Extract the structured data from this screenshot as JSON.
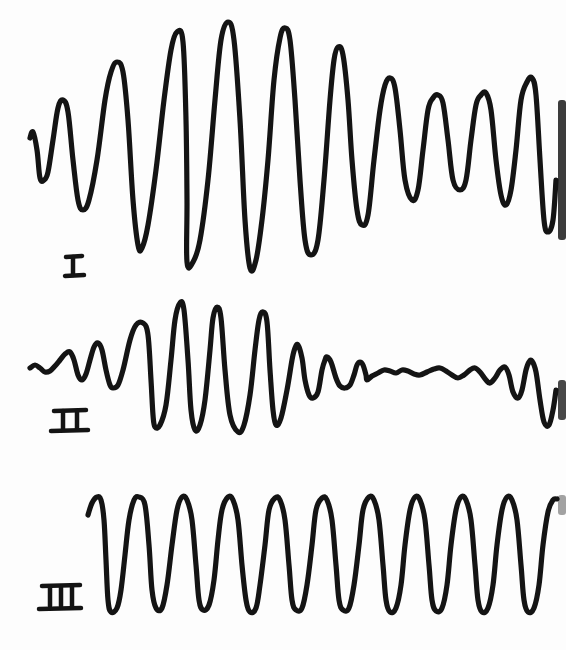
{
  "figure": {
    "background_color": "#fdfdfd",
    "ink_color": "#141414"
  },
  "traces": [
    {
      "label": "I",
      "label_position": {
        "x": 72,
        "y": 268
      },
      "shape": "amplitude builds up to a maximum near the middle then decays slowly (beat-like envelope)",
      "points": [
        [
          30,
          138
        ],
        [
          33,
          132
        ],
        [
          37,
          150
        ],
        [
          40,
          178
        ],
        [
          44,
          180
        ],
        [
          48,
          172
        ],
        [
          53,
          140
        ],
        [
          58,
          108
        ],
        [
          63,
          100
        ],
        [
          68,
          112
        ],
        [
          73,
          160
        ],
        [
          78,
          200
        ],
        [
          83,
          210
        ],
        [
          89,
          200
        ],
        [
          97,
          160
        ],
        [
          105,
          100
        ],
        [
          111,
          72
        ],
        [
          117,
          62
        ],
        [
          123,
          72
        ],
        [
          128,
          120
        ],
        [
          133,
          200
        ],
        [
          138,
          245
        ],
        [
          142,
          248
        ],
        [
          148,
          225
        ],
        [
          156,
          170
        ],
        [
          164,
          100
        ],
        [
          171,
          50
        ],
        [
          177,
          32
        ],
        [
          183,
          42
        ],
        [
          186,
          120
        ],
        [
          187,
          200
        ],
        [
          187,
          262
        ],
        [
          193,
          262
        ],
        [
          200,
          240
        ],
        [
          208,
          180
        ],
        [
          215,
          100
        ],
        [
          221,
          40
        ],
        [
          228,
          22
        ],
        [
          234,
          40
        ],
        [
          240,
          120
        ],
        [
          245,
          220
        ],
        [
          250,
          268
        ],
        [
          256,
          260
        ],
        [
          262,
          220
        ],
        [
          268,
          160
        ],
        [
          274,
          80
        ],
        [
          280,
          38
        ],
        [
          285,
          28
        ],
        [
          290,
          40
        ],
        [
          295,
          100
        ],
        [
          300,
          180
        ],
        [
          305,
          240
        ],
        [
          311,
          255
        ],
        [
          318,
          240
        ],
        [
          324,
          180
        ],
        [
          330,
          100
        ],
        [
          334,
          60
        ],
        [
          338,
          47
        ],
        [
          343,
          55
        ],
        [
          348,
          100
        ],
        [
          352,
          160
        ],
        [
          357,
          210
        ],
        [
          362,
          225
        ],
        [
          368,
          215
        ],
        [
          374,
          160
        ],
        [
          380,
          110
        ],
        [
          385,
          85
        ],
        [
          390,
          78
        ],
        [
          395,
          88
        ],
        [
          400,
          130
        ],
        [
          405,
          180
        ],
        [
          412,
          200
        ],
        [
          418,
          190
        ],
        [
          423,
          150
        ],
        [
          428,
          110
        ],
        [
          433,
          98
        ],
        [
          438,
          95
        ],
        [
          443,
          103
        ],
        [
          448,
          140
        ],
        [
          453,
          180
        ],
        [
          460,
          190
        ],
        [
          466,
          180
        ],
        [
          471,
          140
        ],
        [
          476,
          105
        ],
        [
          481,
          95
        ],
        [
          486,
          93
        ],
        [
          491,
          110
        ],
        [
          496,
          160
        ],
        [
          501,
          195
        ],
        [
          506,
          205
        ],
        [
          511,
          190
        ],
        [
          516,
          150
        ],
        [
          521,
          100
        ],
        [
          527,
          82
        ],
        [
          532,
          78
        ],
        [
          536,
          95
        ],
        [
          540,
          160
        ],
        [
          544,
          220
        ],
        [
          548,
          232
        ],
        [
          553,
          220
        ],
        [
          556,
          180
        ]
      ]
    },
    {
      "label": "II",
      "label_position": {
        "x": 68,
        "y": 415
      },
      "shape": "small start, burst of large oscillations in middle, damped low-amplitude wobble, growing again at right",
      "points": [
        [
          30,
          368
        ],
        [
          35,
          365
        ],
        [
          40,
          368
        ],
        [
          45,
          372
        ],
        [
          50,
          371
        ],
        [
          55,
          366
        ],
        [
          60,
          360
        ],
        [
          65,
          354
        ],
        [
          70,
          352
        ],
        [
          74,
          360
        ],
        [
          78,
          375
        ],
        [
          82,
          380
        ],
        [
          86,
          374
        ],
        [
          90,
          360
        ],
        [
          94,
          347
        ],
        [
          98,
          343
        ],
        [
          102,
          350
        ],
        [
          106,
          370
        ],
        [
          110,
          385
        ],
        [
          113,
          388
        ],
        [
          118,
          385
        ],
        [
          123,
          370
        ],
        [
          130,
          340
        ],
        [
          136,
          325
        ],
        [
          143,
          323
        ],
        [
          148,
          335
        ],
        [
          151,
          380
        ],
        [
          153,
          415
        ],
        [
          155,
          427
        ],
        [
          160,
          425
        ],
        [
          166,
          405
        ],
        [
          171,
          360
        ],
        [
          175,
          320
        ],
        [
          180,
          303
        ],
        [
          184,
          310
        ],
        [
          188,
          360
        ],
        [
          191,
          410
        ],
        [
          195,
          430
        ],
        [
          200,
          425
        ],
        [
          205,
          400
        ],
        [
          210,
          350
        ],
        [
          213,
          318
        ],
        [
          217,
          307
        ],
        [
          221,
          318
        ],
        [
          225,
          370
        ],
        [
          230,
          415
        ],
        [
          238,
          432
        ],
        [
          244,
          425
        ],
        [
          250,
          395
        ],
        [
          255,
          350
        ],
        [
          259,
          320
        ],
        [
          263,
          312
        ],
        [
          267,
          322
        ],
        [
          270,
          370
        ],
        [
          273,
          410
        ],
        [
          276,
          425
        ],
        [
          281,
          418
        ],
        [
          287,
          390
        ],
        [
          292,
          360
        ],
        [
          295,
          348
        ],
        [
          298,
          345
        ],
        [
          302,
          358
        ],
        [
          305,
          380
        ],
        [
          309,
          395
        ],
        [
          313,
          398
        ],
        [
          318,
          392
        ],
        [
          322,
          370
        ],
        [
          325,
          360
        ],
        [
          327,
          357
        ],
        [
          331,
          362
        ],
        [
          336,
          378
        ],
        [
          340,
          386
        ],
        [
          345,
          388
        ],
        [
          350,
          385
        ],
        [
          354,
          375
        ],
        [
          357,
          365
        ],
        [
          360,
          362
        ],
        [
          363,
          365
        ],
        [
          366,
          375
        ],
        [
          367,
          380
        ],
        [
          372,
          376
        ],
        [
          378,
          373
        ],
        [
          384,
          370
        ],
        [
          390,
          371
        ],
        [
          396,
          373
        ],
        [
          402,
          370
        ],
        [
          408,
          371
        ],
        [
          414,
          374
        ],
        [
          420,
          375
        ],
        [
          427,
          372
        ],
        [
          434,
          369
        ],
        [
          440,
          368
        ],
        [
          446,
          371
        ],
        [
          452,
          375
        ],
        [
          458,
          378
        ],
        [
          464,
          375
        ],
        [
          470,
          370
        ],
        [
          475,
          368
        ],
        [
          480,
          372
        ],
        [
          486,
          380
        ],
        [
          490,
          383
        ],
        [
          495,
          378
        ],
        [
          500,
          370
        ],
        [
          505,
          367
        ],
        [
          509,
          375
        ],
        [
          513,
          392
        ],
        [
          518,
          398
        ],
        [
          522,
          390
        ],
        [
          526,
          370
        ],
        [
          529,
          362
        ],
        [
          532,
          361
        ],
        [
          536,
          372
        ],
        [
          540,
          400
        ],
        [
          544,
          422
        ],
        [
          549,
          425
        ],
        [
          553,
          410
        ],
        [
          556,
          390
        ]
      ]
    },
    {
      "label": "III",
      "label_position": {
        "x": 64,
        "y": 605
      },
      "shape": "uniform steady-state sinusoidal oscillation, constant amplitude",
      "points": [
        [
          88,
          515
        ],
        [
          92,
          503
        ],
        [
          97,
          497
        ],
        [
          101,
          500
        ],
        [
          104,
          520
        ],
        [
          106,
          560
        ],
        [
          108,
          600
        ],
        [
          111,
          612
        ],
        [
          117,
          608
        ],
        [
          121,
          590
        ],
        [
          125,
          555
        ],
        [
          129,
          520
        ],
        [
          134,
          500
        ],
        [
          139,
          497
        ],
        [
          145,
          505
        ],
        [
          149,
          545
        ],
        [
          152,
          590
        ],
        [
          156,
          608
        ],
        [
          162,
          608
        ],
        [
          167,
          585
        ],
        [
          172,
          545
        ],
        [
          177,
          510
        ],
        [
          182,
          497
        ],
        [
          187,
          500
        ],
        [
          192,
          520
        ],
        [
          196,
          565
        ],
        [
          199,
          600
        ],
        [
          203,
          610
        ],
        [
          209,
          605
        ],
        [
          214,
          580
        ],
        [
          218,
          540
        ],
        [
          222,
          510
        ],
        [
          228,
          497
        ],
        [
          233,
          500
        ],
        [
          238,
          520
        ],
        [
          242,
          565
        ],
        [
          246,
          600
        ],
        [
          250,
          612
        ],
        [
          256,
          608
        ],
        [
          260,
          585
        ],
        [
          265,
          545
        ],
        [
          269,
          510
        ],
        [
          275,
          498
        ],
        [
          280,
          500
        ],
        [
          285,
          520
        ],
        [
          289,
          565
        ],
        [
          292,
          600
        ],
        [
          296,
          610
        ],
        [
          302,
          608
        ],
        [
          307,
          585
        ],
        [
          312,
          545
        ],
        [
          316,
          510
        ],
        [
          322,
          498
        ],
        [
          327,
          500
        ],
        [
          332,
          520
        ],
        [
          336,
          565
        ],
        [
          339,
          600
        ],
        [
          343,
          610
        ],
        [
          349,
          608
        ],
        [
          354,
          585
        ],
        [
          359,
          545
        ],
        [
          363,
          510
        ],
        [
          369,
          497
        ],
        [
          374,
          500
        ],
        [
          379,
          520
        ],
        [
          383,
          565
        ],
        [
          386,
          600
        ],
        [
          390,
          612
        ],
        [
          396,
          608
        ],
        [
          401,
          585
        ],
        [
          405,
          545
        ],
        [
          410,
          510
        ],
        [
          415,
          497
        ],
        [
          420,
          500
        ],
        [
          425,
          520
        ],
        [
          429,
          565
        ],
        [
          432,
          600
        ],
        [
          436,
          611
        ],
        [
          442,
          608
        ],
        [
          447,
          585
        ],
        [
          451,
          545
        ],
        [
          456,
          510
        ],
        [
          461,
          497
        ],
        [
          466,
          500
        ],
        [
          471,
          520
        ],
        [
          475,
          565
        ],
        [
          478,
          600
        ],
        [
          482,
          612
        ],
        [
          488,
          608
        ],
        [
          493,
          585
        ],
        [
          497,
          545
        ],
        [
          502,
          510
        ],
        [
          507,
          497
        ],
        [
          512,
          500
        ],
        [
          517,
          520
        ],
        [
          521,
          565
        ],
        [
          524,
          600
        ],
        [
          528,
          612
        ],
        [
          534,
          608
        ],
        [
          539,
          585
        ],
        [
          543,
          545
        ],
        [
          548,
          512
        ],
        [
          553,
          500
        ],
        [
          557,
          499
        ]
      ]
    }
  ]
}
